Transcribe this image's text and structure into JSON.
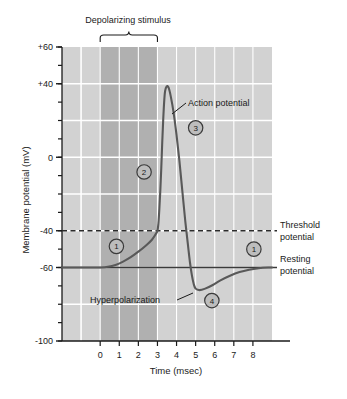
{
  "chart_data": {
    "type": "line",
    "title": "",
    "xlabel": "Time (msec)",
    "ylabel": "Membrane potential (mV)",
    "xlim": [
      -2,
      9
    ],
    "ylim": [
      -100,
      60
    ],
    "xticks": [
      0,
      1,
      2,
      3,
      4,
      5,
      6,
      7,
      8
    ],
    "xtick_labels": [
      "0",
      "1",
      "2",
      "3",
      "4",
      "5",
      "6",
      "7",
      "8"
    ],
    "yticks": [
      -100,
      -90,
      -80,
      -70,
      -60,
      -50,
      -40,
      -30,
      -20,
      -10,
      0,
      10,
      20,
      30,
      40,
      50,
      60
    ],
    "ytick_labels": [
      "-100",
      "",
      "",
      "",
      "-60",
      "",
      "-40",
      "",
      "",
      "",
      "0",
      "",
      "",
      "",
      "+40",
      "",
      "+60"
    ],
    "ylabeled_ticks": [
      {
        "value": 60,
        "label": "+60"
      },
      {
        "value": 40,
        "label": "+40"
      },
      {
        "value": 0,
        "label": "0"
      },
      {
        "value": -40,
        "label": "-40"
      },
      {
        "value": -60,
        "label": "-60"
      },
      {
        "value": -100,
        "label": "-100"
      }
    ],
    "grid": true,
    "grid_color": "#ffffff",
    "plot_bg": "#d2d2d2",
    "stimulus_band": {
      "x0": 0,
      "x1": 3,
      "color": "#b0b0b0",
      "label": "Depolarizing stimulus"
    },
    "series": [
      {
        "name": "Membrane potential",
        "color": "#595959",
        "points": [
          [
            -2.0,
            -60
          ],
          [
            -1.0,
            -60
          ],
          [
            -0.2,
            -60
          ],
          [
            0.0,
            -60
          ],
          [
            0.4,
            -59.6
          ],
          [
            0.8,
            -58.6
          ],
          [
            1.2,
            -56.8
          ],
          [
            1.6,
            -54.4
          ],
          [
            2.0,
            -51.4
          ],
          [
            2.4,
            -48.0
          ],
          [
            2.7,
            -45.0
          ],
          [
            2.9,
            -42.0
          ],
          [
            3.0,
            -40.0
          ],
          [
            3.05,
            -36.0
          ],
          [
            3.1,
            -28.0
          ],
          [
            3.15,
            -18.0
          ],
          [
            3.2,
            -6.0
          ],
          [
            3.25,
            8.0
          ],
          [
            3.3,
            20.0
          ],
          [
            3.35,
            30.0
          ],
          [
            3.4,
            36.0
          ],
          [
            3.48,
            38.5
          ],
          [
            3.58,
            38.0
          ],
          [
            3.7,
            33.0
          ],
          [
            3.85,
            24.0
          ],
          [
            4.0,
            12.0
          ],
          [
            4.15,
            -2.0
          ],
          [
            4.3,
            -18.0
          ],
          [
            4.45,
            -34.0
          ],
          [
            4.6,
            -48.0
          ],
          [
            4.7,
            -57.0
          ],
          [
            4.8,
            -64.0
          ],
          [
            4.9,
            -69.0
          ],
          [
            5.0,
            -71.5
          ],
          [
            5.2,
            -72.3
          ],
          [
            5.5,
            -71.5
          ],
          [
            5.9,
            -69.5
          ],
          [
            6.3,
            -67.0
          ],
          [
            6.8,
            -64.5
          ],
          [
            7.3,
            -62.5
          ],
          [
            7.8,
            -61.2
          ],
          [
            8.3,
            -60.4
          ],
          [
            8.8,
            -60.0
          ],
          [
            9.0,
            -60.0
          ]
        ]
      }
    ],
    "reference_lines": [
      {
        "name": "threshold",
        "value": -40,
        "style": "dashed",
        "color": "#2b2b2b",
        "label": "Threshold potential"
      },
      {
        "name": "resting",
        "value": -60,
        "style": "solid",
        "color": "#3a3a3a",
        "label": "Resting potential"
      }
    ],
    "annotations": [
      {
        "name": "action-potential",
        "text": "Action potential",
        "x": 4.35,
        "y": 25,
        "leader": true
      },
      {
        "name": "hyperpolarization",
        "text": "Hyperpolarization",
        "x": 2.35,
        "y": -77,
        "leader": true
      }
    ],
    "phase_markers": [
      {
        "id": "1",
        "x": 0.85,
        "y": -48.5
      },
      {
        "id": "2",
        "x": 2.3,
        "y": -8
      },
      {
        "id": "3",
        "x": 5.0,
        "y": 16
      },
      {
        "id": "4",
        "x": 5.85,
        "y": -78
      },
      {
        "id": "1b",
        "x": 8.05,
        "y": -50
      }
    ]
  },
  "labels": {
    "stimulus": "Depolarizing stimulus",
    "xaxis_title": "Time (msec)",
    "yaxis_title": "Membrane potential (mV)",
    "threshold_line1": "Threshold",
    "threshold_line2": "potential",
    "resting_line1": "Resting",
    "resting_line2": "potential",
    "action_potential": "Action potential",
    "hyperpolarization": "Hyperpolarization"
  },
  "ticks": {
    "x": [
      "0",
      "1",
      "2",
      "3",
      "4",
      "5",
      "6",
      "7",
      "8"
    ],
    "y": [
      "+60",
      "+40",
      "0",
      "-40",
      "-60",
      "-100"
    ]
  },
  "markers": {
    "m1": "1",
    "m2": "2",
    "m3": "3",
    "m4": "4",
    "m1b": "1"
  },
  "colors": {
    "plot_background": "#d2d2d2",
    "stimulus_band": "#b0b0b0",
    "grid": "#ffffff",
    "curve": "#595959",
    "axis": "#1a1a1a",
    "page_background": "#ffffff"
  }
}
